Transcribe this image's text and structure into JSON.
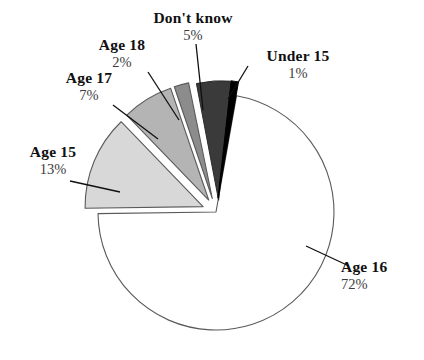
{
  "chart_data": {
    "type": "pie",
    "title": "",
    "subtitle": "",
    "xlabel": "",
    "ylabel": "",
    "legend_position": "none",
    "grid": false,
    "value_unit": "%",
    "categories": [
      "Under 15",
      "Age 15",
      "Age 16",
      "Age 17",
      "Age 18",
      "Don't know"
    ],
    "values": [
      1,
      13,
      72,
      7,
      2,
      5
    ],
    "slices": [
      {
        "label": "Age 16",
        "value": 72,
        "value_text": "72%",
        "color": "#ffffff",
        "stroke": "#5a5a5a",
        "exploded": false,
        "start_angle_deg": -80,
        "end_angle_deg": 179.2,
        "label_x": 341,
        "label_y": 258,
        "leader": true
      },
      {
        "label": "Age 15",
        "value": 13,
        "value_text": "13%",
        "color": "#d8d8d8",
        "stroke": "#5a5a5a",
        "exploded": true,
        "start_angle_deg": 179.2,
        "end_angle_deg": 226.0,
        "label_x": 6,
        "label_y": 143,
        "leader": true
      },
      {
        "label": "Age 17",
        "value": 7,
        "value_text": "7%",
        "color": "#b4b4b4",
        "stroke": "#5a5a5a",
        "exploded": true,
        "start_angle_deg": 226.0,
        "end_angle_deg": 251.2,
        "label_x": 44,
        "label_y": 69,
        "leader": true
      },
      {
        "label": "Age 18",
        "value": 2,
        "value_text": "2%",
        "color": "#8c8c8c",
        "stroke": "#5a5a5a",
        "exploded": true,
        "start_angle_deg": 251.2,
        "end_angle_deg": 258.4,
        "label_x": 77,
        "label_y": 36,
        "leader": true
      },
      {
        "label": "Don't know",
        "value": 5,
        "value_text": "5%",
        "color": "#3a3a3a",
        "stroke": "#2a2a2a",
        "exploded": true,
        "start_angle_deg": 258.4,
        "end_angle_deg": 276.4,
        "label_x": 133,
        "label_y": 9,
        "leader": true
      },
      {
        "label": "Under 15",
        "value": 1,
        "value_text": "1%",
        "color": "#000000",
        "stroke": "#000000",
        "exploded": true,
        "start_angle_deg": 276.4,
        "end_angle_deg": 280.0,
        "label_x": 243,
        "label_y": 47,
        "leader": true
      }
    ],
    "geometry": {
      "center_x": 216,
      "center_y": 212,
      "radius": 118,
      "explode_offset": 14
    }
  },
  "labels": {
    "dont_know": {
      "name": "Don't know",
      "pct": "5%"
    },
    "under_15": {
      "name": "Under 15",
      "pct": "1%"
    },
    "age_18": {
      "name": "Age 18",
      "pct": "2%"
    },
    "age_17": {
      "name": "Age 17",
      "pct": "7%"
    },
    "age_15": {
      "name": "Age 15",
      "pct": "13%"
    },
    "age_16": {
      "name": "Age 16",
      "pct": "72%"
    }
  },
  "colors": {
    "age_15": "#d8d8d8",
    "age_16": "#ffffff",
    "age_17": "#b4b4b4",
    "age_18": "#8c8c8c",
    "dont_know": "#3a3a3a",
    "under_15": "#000000",
    "outline": "#5a5a5a",
    "leader_line": "#101010",
    "text": "#101010",
    "background": "#ffffff"
  }
}
